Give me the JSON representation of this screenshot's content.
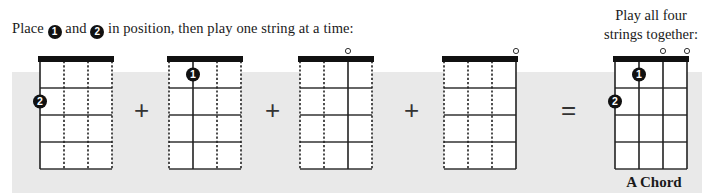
{
  "instruction": {
    "before": "Place ",
    "badge1": "1",
    "middle": " and ",
    "badge2": "2",
    "after": " in position, then play one string at a time:"
  },
  "right_title": {
    "line1": "Play all four",
    "line2": "strings together:"
  },
  "operators": [
    "+",
    "+",
    "+",
    "="
  ],
  "chord_name": "A Chord",
  "colors": {
    "band": "#e9e9e9",
    "ink": "#111111",
    "grid": "#333333"
  },
  "diagrams": [
    {
      "id": "step-1",
      "x": 40,
      "solid_string": 0,
      "open": [],
      "fingers": [
        {
          "label": "2",
          "string": 0,
          "fret": 2
        }
      ]
    },
    {
      "id": "step-2",
      "x": 169,
      "solid_string": 1,
      "open": [],
      "fingers": [
        {
          "label": "1",
          "string": 1,
          "fret": 1
        }
      ]
    },
    {
      "id": "step-3",
      "x": 300,
      "solid_string": 2,
      "open": [
        2
      ],
      "fingers": []
    },
    {
      "id": "step-4",
      "x": 444,
      "solid_string": 3,
      "open": [
        3
      ],
      "fingers": []
    },
    {
      "id": "a-chord",
      "x": 615,
      "solid_string": "all",
      "open": [
        2,
        3
      ],
      "fingers": [
        {
          "label": "1",
          "string": 1,
          "fret": 1
        },
        {
          "label": "2",
          "string": 0,
          "fret": 2
        }
      ]
    }
  ],
  "fretboard": {
    "strings": 4,
    "frets": 4,
    "width": 76,
    "fret_height": 27
  }
}
